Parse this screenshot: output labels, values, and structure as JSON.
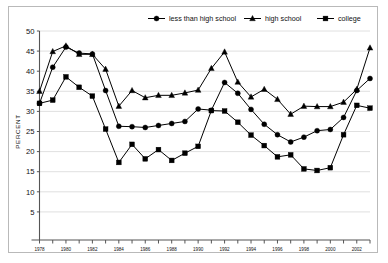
{
  "chart_data": {
    "type": "line",
    "title": "",
    "xlabel": "",
    "ylabel": "PERCENT",
    "ylim": [
      0,
      50
    ],
    "ytick_step": 5,
    "yticks": [
      0,
      5,
      10,
      15,
      20,
      25,
      30,
      35,
      40,
      45,
      50
    ],
    "ytick_labels": [
      "",
      "5",
      "10",
      "15",
      "20",
      "25",
      "30",
      "35",
      "40",
      "45",
      "50"
    ],
    "xlim": [
      1978,
      2003
    ],
    "x": [
      1978,
      1979,
      1980,
      1981,
      1982,
      1983,
      1984,
      1985,
      1986,
      1987,
      1988,
      1989,
      1990,
      1991,
      1992,
      1993,
      1994,
      1995,
      1996,
      1997,
      1998,
      1999,
      2000,
      2001,
      2002,
      2003
    ],
    "xticks": [
      1978,
      1979,
      1980,
      1981,
      1982,
      1983,
      1984,
      1985,
      1986,
      1987,
      1988,
      1989,
      1990,
      1991,
      1992,
      1993,
      1994,
      1995,
      1996,
      1997,
      1998,
      1999,
      2000,
      2001,
      2002,
      2003
    ],
    "xtick_labels": [
      "1978",
      "",
      "1980",
      "",
      "1982",
      "",
      "1984",
      "",
      "1986",
      "",
      "1988",
      "",
      "1990",
      "",
      "1992",
      "",
      "1994",
      "",
      "1996",
      "",
      "1998",
      "",
      "2000",
      "",
      "2002",
      ""
    ],
    "grid": "horizontal",
    "legend_position": "top",
    "series": [
      {
        "name": "less than high school",
        "marker": "circle",
        "values": [
          32.0,
          41.0,
          46.0,
          44.5,
          44.3,
          35.2,
          26.3,
          26.2,
          26.0,
          26.5,
          27.0,
          27.5,
          30.6,
          30.3,
          37.2,
          34.5,
          30.5,
          26.8,
          24.2,
          22.4,
          23.6,
          25.2,
          25.5,
          28.5,
          35.2,
          38.2
        ]
      },
      {
        "name": "high school",
        "marker": "triangle",
        "values": [
          35.0,
          44.9,
          46.3,
          44.2,
          44.2,
          40.5,
          31.3,
          35.2,
          33.4,
          34.0,
          34.0,
          34.6,
          35.3,
          40.7,
          44.8,
          37.3,
          33.6,
          35.5,
          33.0,
          29.3,
          31.3,
          31.2,
          31.2,
          32.3,
          35.5,
          45.8
        ]
      },
      {
        "name": "college",
        "marker": "square",
        "values": [
          32.0,
          32.8,
          38.6,
          36.0,
          33.8,
          25.6,
          17.3,
          21.8,
          18.2,
          20.5,
          17.8,
          19.6,
          21.3,
          30.2,
          30.1,
          27.3,
          24.1,
          21.5,
          18.7,
          19.2,
          15.7,
          15.3,
          16.0,
          24.2,
          31.5,
          30.8
        ]
      }
    ]
  },
  "legend": {
    "items": [
      {
        "label": "less than high school",
        "marker": "circle"
      },
      {
        "label": "high school",
        "marker": "triangle"
      },
      {
        "label": "college",
        "marker": "square"
      }
    ]
  },
  "colors": {
    "line": "#000000",
    "marker": "#000000",
    "grid": "#d8d8d8",
    "axis": "#555555",
    "frame": "#b9b9b9",
    "background": "#ffffff",
    "text": "#111111"
  }
}
